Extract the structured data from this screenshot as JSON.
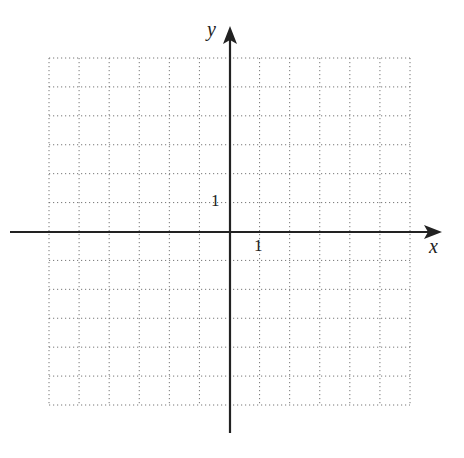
{
  "diagram": {
    "type": "coordinate-grid",
    "x_axis_label": "x",
    "y_axis_label": "y",
    "x_tick_label": "1",
    "y_tick_label": "1",
    "x_range": [
      -6,
      6
    ],
    "y_range": [
      -6,
      6
    ],
    "grid_style": "dotted",
    "colors": {
      "axis": "#222222",
      "grid": "#777777"
    }
  }
}
